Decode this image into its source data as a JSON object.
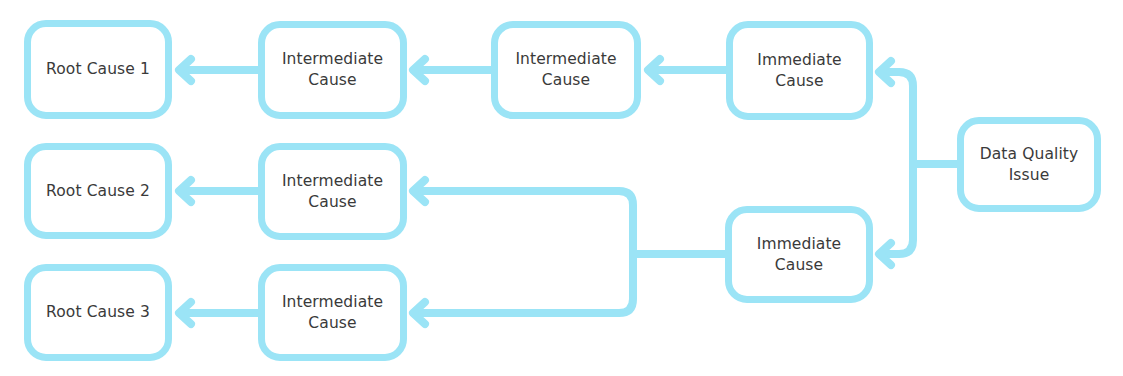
{
  "diagram": {
    "type": "root-cause-analysis",
    "stroke_color": "#9be4f6",
    "text_color": "#3a3a3a",
    "nodes": {
      "root_cause_1": {
        "label": "Root Cause 1"
      },
      "root_cause_2": {
        "label": "Root Cause 2"
      },
      "root_cause_3": {
        "label": "Root Cause 3"
      },
      "intermediate_1a": {
        "label": "Intermediate\nCause"
      },
      "intermediate_1b": {
        "label": "Intermediate\nCause"
      },
      "intermediate_2": {
        "label": "Intermediate\nCause"
      },
      "intermediate_3": {
        "label": "Intermediate\nCause"
      },
      "immediate_1": {
        "label": "Immediate\nCause"
      },
      "immediate_2": {
        "label": "Immediate\nCause"
      },
      "data_quality_issue": {
        "label": "Data Quality\nIssue"
      }
    },
    "edges": [
      {
        "from": "data_quality_issue",
        "to": "immediate_1"
      },
      {
        "from": "data_quality_issue",
        "to": "immediate_2"
      },
      {
        "from": "immediate_1",
        "to": "intermediate_1b"
      },
      {
        "from": "intermediate_1b",
        "to": "intermediate_1a"
      },
      {
        "from": "intermediate_1a",
        "to": "root_cause_1"
      },
      {
        "from": "immediate_2",
        "to": "intermediate_2"
      },
      {
        "from": "immediate_2",
        "to": "intermediate_3"
      },
      {
        "from": "intermediate_2",
        "to": "root_cause_2"
      },
      {
        "from": "intermediate_3",
        "to": "root_cause_3"
      }
    ]
  }
}
